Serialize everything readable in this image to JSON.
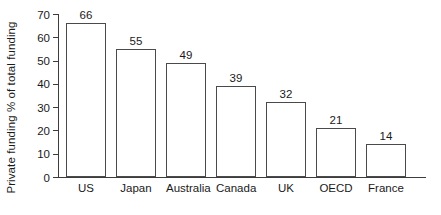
{
  "chart_data": {
    "type": "bar",
    "title": "",
    "subtitle": "",
    "xlabel": "",
    "ylabel": "Private funding % of total funding",
    "categories": [
      "US",
      "Japan",
      "Australia",
      "Canada",
      "UK",
      "OECD",
      "France"
    ],
    "values": [
      66,
      55,
      49,
      39,
      32,
      21,
      14
    ],
    "value_labels": [
      "66",
      "55",
      "49",
      "39",
      "32",
      "21",
      "14"
    ],
    "ylim": [
      0,
      70
    ],
    "ytick_values": [
      0,
      10,
      20,
      30,
      40,
      50,
      60,
      70
    ],
    "ytick_labels": [
      "0",
      "10",
      "20",
      "30",
      "40",
      "50",
      "60",
      "70"
    ],
    "grid": false,
    "legend": null,
    "legend_position": "none",
    "bar_fill_color": "#ffffff",
    "bar_edge_color": "#4a4a4a",
    "axis_color": "#3c3c3c",
    "text_color": "#1a1a1a",
    "background_color": "#ffffff"
  }
}
